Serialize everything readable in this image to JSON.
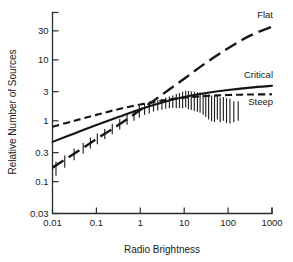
{
  "chart_data": {
    "type": "line",
    "title": "",
    "xlabel": "Radio Brightness",
    "ylabel": "Relative Number of Sources",
    "xscale": "log",
    "yscale": "log",
    "xlim": [
      0.01,
      1000
    ],
    "ylim": [
      0.03,
      60
    ],
    "grid": false,
    "legend_position": "inline-right",
    "xticks": [
      0.01,
      0.1,
      1,
      10,
      100,
      1000
    ],
    "xtick_labels": [
      "0.01",
      "0.1",
      "1",
      "10",
      "100",
      "1000"
    ],
    "yticks": [
      0.03,
      0.1,
      0.3,
      1,
      3,
      10,
      30
    ],
    "ytick_labels": [
      "0.03",
      "0.1",
      "0.3",
      "1",
      "3",
      "10",
      "30"
    ],
    "series": [
      {
        "name": "Flat",
        "style": "long-dashed",
        "label": "Flat",
        "x": [
          0.01,
          0.0316,
          0.1,
          0.316,
          1,
          3.16,
          10,
          31.6,
          100,
          316,
          1000
        ],
        "y": [
          0.17,
          0.29,
          0.5,
          0.85,
          1.5,
          2.7,
          4.9,
          9.0,
          15.5,
          25.0,
          35.0
        ]
      },
      {
        "name": "Critical",
        "style": "solid",
        "label": "Critical",
        "x": [
          0.01,
          0.0316,
          0.1,
          0.316,
          1,
          3.16,
          10,
          31.6,
          100,
          316,
          1000
        ],
        "y": [
          0.45,
          0.62,
          0.85,
          1.15,
          1.55,
          2.0,
          2.45,
          2.85,
          3.2,
          3.5,
          3.75
        ]
      },
      {
        "name": "Steep",
        "style": "short-dashed",
        "label": "Steep",
        "x": [
          0.01,
          0.0316,
          0.1,
          0.316,
          1,
          3.16,
          10,
          31.6,
          100,
          316,
          1000
        ],
        "y": [
          0.8,
          1.0,
          1.25,
          1.55,
          1.85,
          2.15,
          2.4,
          2.55,
          2.65,
          2.7,
          2.72
        ]
      }
    ],
    "errorbars": [
      {
        "x": 0.012,
        "y": 0.165,
        "ylow": 0.125,
        "yhigh": 0.215
      },
      {
        "x": 0.019,
        "y": 0.215,
        "ylow": 0.17,
        "yhigh": 0.27
      },
      {
        "x": 0.031,
        "y": 0.28,
        "ylow": 0.225,
        "yhigh": 0.35
      },
      {
        "x": 0.05,
        "y": 0.35,
        "ylow": 0.29,
        "yhigh": 0.43
      },
      {
        "x": 0.073,
        "y": 0.43,
        "ylow": 0.35,
        "yhigh": 0.53
      },
      {
        "x": 0.105,
        "y": 0.5,
        "ylow": 0.41,
        "yhigh": 0.62
      },
      {
        "x": 0.155,
        "y": 0.6,
        "ylow": 0.5,
        "yhigh": 0.73
      },
      {
        "x": 0.23,
        "y": 0.73,
        "ylow": 0.6,
        "yhigh": 0.89
      },
      {
        "x": 0.34,
        "y": 0.88,
        "ylow": 0.72,
        "yhigh": 1.07
      },
      {
        "x": 0.5,
        "y": 1.05,
        "ylow": 0.86,
        "yhigh": 1.28
      },
      {
        "x": 0.72,
        "y": 1.22,
        "ylow": 1.0,
        "yhigh": 1.5
      },
      {
        "x": 0.95,
        "y": 1.4,
        "ylow": 1.12,
        "yhigh": 1.75
      },
      {
        "x": 1.25,
        "y": 1.55,
        "ylow": 1.25,
        "yhigh": 1.92
      },
      {
        "x": 1.6,
        "y": 1.62,
        "ylow": 1.32,
        "yhigh": 2.0
      },
      {
        "x": 2.0,
        "y": 1.72,
        "ylow": 1.42,
        "yhigh": 2.1
      },
      {
        "x": 2.5,
        "y": 1.8,
        "ylow": 1.48,
        "yhigh": 2.2
      },
      {
        "x": 3.1,
        "y": 1.88,
        "ylow": 1.52,
        "yhigh": 2.3
      },
      {
        "x": 3.8,
        "y": 1.95,
        "ylow": 1.58,
        "yhigh": 2.4
      },
      {
        "x": 4.6,
        "y": 2.0,
        "ylow": 1.6,
        "yhigh": 2.5
      },
      {
        "x": 5.5,
        "y": 2.05,
        "ylow": 1.62,
        "yhigh": 2.6
      },
      {
        "x": 6.6,
        "y": 2.1,
        "ylow": 1.6,
        "yhigh": 2.75
      },
      {
        "x": 7.8,
        "y": 2.15,
        "ylow": 1.62,
        "yhigh": 2.85
      },
      {
        "x": 9.2,
        "y": 2.2,
        "ylow": 1.6,
        "yhigh": 3.0
      },
      {
        "x": 10.8,
        "y": 2.25,
        "ylow": 1.65,
        "yhigh": 3.1
      },
      {
        "x": 12.5,
        "y": 2.2,
        "ylow": 1.55,
        "yhigh": 3.1
      },
      {
        "x": 14.5,
        "y": 2.15,
        "ylow": 1.5,
        "yhigh": 3.05
      },
      {
        "x": 17,
        "y": 2.1,
        "ylow": 1.45,
        "yhigh": 3.0
      },
      {
        "x": 20,
        "y": 2.05,
        "ylow": 1.4,
        "yhigh": 2.95
      },
      {
        "x": 23,
        "y": 2.0,
        "ylow": 1.35,
        "yhigh": 2.9
      },
      {
        "x": 27,
        "y": 1.95,
        "ylow": 1.25,
        "yhigh": 2.85
      },
      {
        "x": 31,
        "y": 1.85,
        "ylow": 1.15,
        "yhigh": 2.8
      },
      {
        "x": 36,
        "y": 1.75,
        "ylow": 1.05,
        "yhigh": 2.7
      },
      {
        "x": 42,
        "y": 1.65,
        "ylow": 0.98,
        "yhigh": 2.6
      },
      {
        "x": 49,
        "y": 1.6,
        "ylow": 0.95,
        "yhigh": 2.55
      },
      {
        "x": 57,
        "y": 1.7,
        "ylow": 1.05,
        "yhigh": 2.6
      },
      {
        "x": 66,
        "y": 1.55,
        "ylow": 0.95,
        "yhigh": 2.4
      },
      {
        "x": 78,
        "y": 1.6,
        "ylow": 1.0,
        "yhigh": 2.45
      },
      {
        "x": 92,
        "y": 1.5,
        "ylow": 0.92,
        "yhigh": 2.35
      },
      {
        "x": 110,
        "y": 1.45,
        "ylow": 0.9,
        "yhigh": 2.3
      },
      {
        "x": 135,
        "y": 1.4,
        "ylow": 0.95,
        "yhigh": 2.1
      },
      {
        "x": 170,
        "y": 1.45,
        "ylow": 1.0,
        "yhigh": 2.1
      }
    ]
  }
}
